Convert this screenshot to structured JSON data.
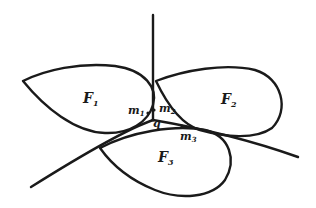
{
  "diagram": {
    "colors": {
      "stroke": "#1a1a1a",
      "background": "#ffffff"
    },
    "regions": [
      {
        "id": "F1",
        "label": "F",
        "subscript": "1"
      },
      {
        "id": "F2",
        "label": "F",
        "subscript": "2"
      },
      {
        "id": "F3",
        "label": "F",
        "subscript": "3"
      }
    ],
    "points": [
      {
        "id": "m1",
        "label": "m",
        "subscript": "1"
      },
      {
        "id": "m2",
        "label": "m",
        "subscript": "2"
      },
      {
        "id": "m3",
        "label": "m",
        "subscript": "3"
      },
      {
        "id": "q",
        "label": "q"
      }
    ],
    "rays": [
      {
        "id": "ray-up",
        "from": "q",
        "direction": "up"
      },
      {
        "id": "ray-lower-left",
        "from": "q",
        "direction": "lower-left"
      },
      {
        "id": "ray-lower-right",
        "from": "q",
        "direction": "lower-right"
      }
    ]
  }
}
